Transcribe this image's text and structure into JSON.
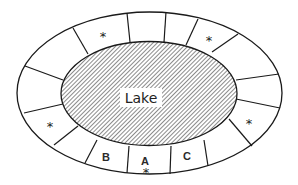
{
  "diagram": {
    "type": "plot-map-around-lake",
    "colors": {
      "line": "#1a1a1a",
      "background": "#ffffff",
      "hatch": "#6e6e6e",
      "label_box": "#ffffff"
    },
    "lake": {
      "label": "Lake",
      "pattern": "diagonal-hatch"
    },
    "ring": {
      "plot_count": 16,
      "plots": [
        {
          "id": "top-1",
          "label": "",
          "marked": false
        },
        {
          "id": "top-2",
          "label": "",
          "marked": false
        },
        {
          "id": "top-right-1",
          "label": "",
          "marked": true
        },
        {
          "id": "top-right-2",
          "label": "",
          "marked": false
        },
        {
          "id": "right-1",
          "label": "",
          "marked": false
        },
        {
          "id": "right-2",
          "label": "",
          "marked": true
        },
        {
          "id": "bottom-right-1",
          "label": "",
          "marked": false
        },
        {
          "id": "bottom-right-2",
          "label": "C",
          "marked": false
        },
        {
          "id": "bottom",
          "label": "A",
          "marked": true
        },
        {
          "id": "bottom-left-1",
          "label": "B",
          "marked": false
        },
        {
          "id": "bottom-left-2",
          "label": "",
          "marked": false
        },
        {
          "id": "left-1",
          "label": "",
          "marked": true
        },
        {
          "id": "left-2",
          "label": "",
          "marked": false
        },
        {
          "id": "top-left-1",
          "label": "",
          "marked": false
        },
        {
          "id": "top-left-2",
          "label": "",
          "marked": true
        },
        {
          "id": "top-0",
          "label": "",
          "marked": false
        }
      ],
      "marker_symbol": "*"
    },
    "labels": {
      "a": "A",
      "b": "B",
      "c": "C",
      "star": "*"
    }
  }
}
